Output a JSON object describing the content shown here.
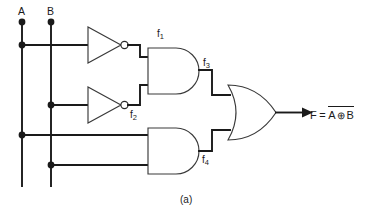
{
  "figure": {
    "caption": "(a)",
    "type": "logic-circuit-diagram"
  },
  "inputs": [
    {
      "id": "A",
      "label": "A"
    },
    {
      "id": "B",
      "label": "B"
    }
  ],
  "gates": [
    {
      "id": "inv1",
      "type": "NOT",
      "output_label": "f",
      "output_sub": "1"
    },
    {
      "id": "inv2",
      "type": "NOT",
      "output_label": "f",
      "output_sub": "2"
    },
    {
      "id": "and1",
      "type": "AND",
      "output_label": "f",
      "output_sub": "3"
    },
    {
      "id": "and2",
      "type": "AND",
      "output_label": "f",
      "output_sub": "4"
    },
    {
      "id": "or1",
      "type": "OR",
      "output_label": "F"
    }
  ],
  "signals": {
    "f1": {
      "label": "f",
      "sub": "1"
    },
    "f2": {
      "label": "f",
      "sub": "2"
    },
    "f3": {
      "label": "f",
      "sub": "3"
    },
    "f4": {
      "label": "f",
      "sub": "4"
    }
  },
  "output": {
    "name": "F",
    "equals": "=",
    "operand_left": "A",
    "operator": "⊕",
    "operand_right": "B",
    "overbar": true,
    "expression_text": "F = A ⊕ B (complemented)"
  },
  "colors": {
    "wire": "#1a1a1a",
    "gate_stroke": "#3a3a3a",
    "background": "#ffffff",
    "text": "#1a1a1a"
  }
}
